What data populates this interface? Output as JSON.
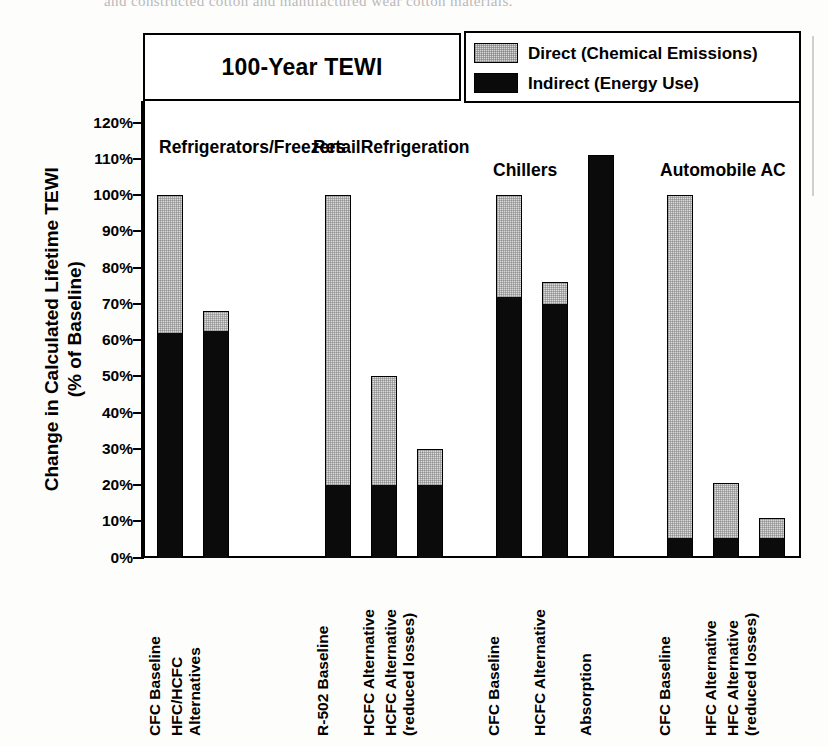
{
  "page": {
    "scan_top_text": "and constructed cotton and manufactured wear cotton materials."
  },
  "chart_data": {
    "type": "bar",
    "title": "100-Year TEWI",
    "ylabel_line1": "Change in Calculated Lifetime TEWI",
    "ylabel_line2": "(% of Baseline)",
    "xlabel": "",
    "ylim": [
      0,
      120
    ],
    "ytick_labels": [
      "0%",
      "10%",
      "20%",
      "30%",
      "40%",
      "50%",
      "60%",
      "70%",
      "80%",
      "90%",
      "100%",
      "110%",
      "120%"
    ],
    "ytick_values": [
      0,
      10,
      20,
      30,
      40,
      50,
      60,
      70,
      80,
      90,
      100,
      110,
      120
    ],
    "grid": false,
    "stacked": true,
    "legend_position": "top-right",
    "legend": [
      {
        "name": "Direct (Chemical Emissions)",
        "swatch": "light-stipple"
      },
      {
        "name": "Indirect (Energy Use)",
        "swatch": "solid-black"
      }
    ],
    "series": [
      {
        "name": "Indirect (Energy Use)",
        "values": [
          62.0,
          62.5,
          20.0,
          20.0,
          20.0,
          72.0,
          70.0,
          111.0,
          5.5,
          5.5,
          5.5
        ]
      },
      {
        "name": "Direct (Chemical Emissions)",
        "values": [
          38.0,
          5.5,
          80.0,
          30.0,
          10.0,
          28.0,
          6.0,
          0.0,
          94.5,
          15.0,
          5.5
        ]
      }
    ],
    "totals": [
      100.0,
      68.0,
      100.0,
      50.0,
      30.0,
      100.0,
      76.0,
      111.0,
      100.0,
      20.5,
      11.0
    ],
    "categories": [
      "CFC Baseline",
      "HFC/HCFC Alternatives",
      "R-502 Baseline",
      "HCFC Alternative",
      "HCFC Alternative (reduced losses)",
      "CFC Baseline",
      "HCFC Alternative",
      "Absorption",
      "CFC Baseline",
      "HFC Alternative",
      "HFC Alternative (reduced losses)"
    ],
    "groups": [
      {
        "label_line1": "Refrigerators/",
        "label_line2": "Freezers",
        "bar_indices": [
          0,
          1
        ]
      },
      {
        "label_line1": "Retail",
        "label_line2": "Refrigeration",
        "bar_indices": [
          2,
          3,
          4
        ]
      },
      {
        "label_line1": "Chillers",
        "label_line2": "",
        "bar_indices": [
          5,
          6,
          7
        ]
      },
      {
        "label_line1": "Automobile AC",
        "label_line2": "",
        "bar_indices": [
          8,
          9,
          10
        ]
      }
    ],
    "colors": {
      "direct": "#dcdcdc",
      "indirect": "#0b0b0b",
      "axis": "#000000"
    }
  },
  "xlabels_wrapped": [
    {
      "l1": "CFC Baseline",
      "l2": ""
    },
    {
      "l1": "HFC/HCFC",
      "l2": "Alternatives"
    },
    {
      "l1": "R-502 Baseline",
      "l2": ""
    },
    {
      "l1": "HCFC Alternative",
      "l2": ""
    },
    {
      "l1": "HCFC Alternative",
      "l2": "(reduced losses)"
    },
    {
      "l1": "CFC Baseline",
      "l2": ""
    },
    {
      "l1": "HCFC Alternative",
      "l2": ""
    },
    {
      "l1": "Absorption",
      "l2": ""
    },
    {
      "l1": "CFC Baseline",
      "l2": ""
    },
    {
      "l1": "HFC Alternative",
      "l2": ""
    },
    {
      "l1": "HFC Alternative",
      "l2": "(reduced losses)"
    }
  ]
}
